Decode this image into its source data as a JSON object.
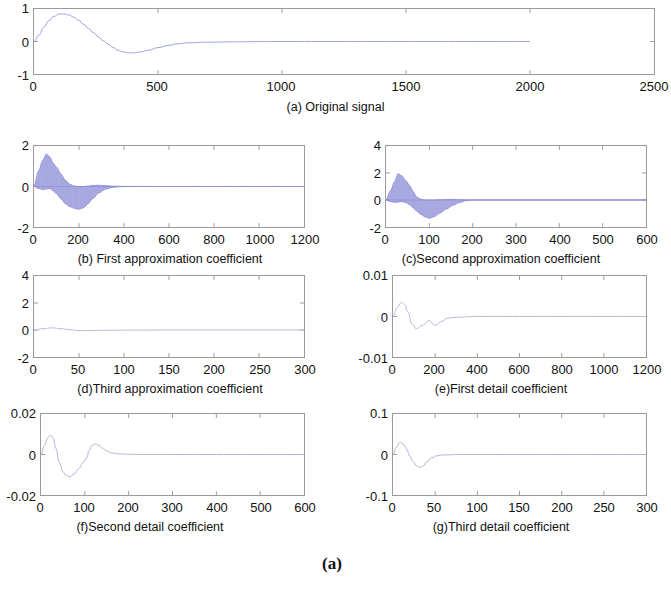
{
  "figure": {
    "label": "(a)",
    "panels": [
      {
        "key": "a",
        "caption": "(a) Original signal",
        "xticks": [
          "0",
          "500",
          "1000",
          "1500",
          "2000",
          "2500"
        ],
        "yticks": [
          "1",
          "0",
          "-1"
        ],
        "xlim": [
          0,
          2500
        ],
        "ylim": [
          -1,
          1
        ]
      },
      {
        "key": "b",
        "caption": "(b) First approximation coefficient",
        "xticks": [
          "0",
          "200",
          "400",
          "600",
          "800",
          "1000",
          "1200"
        ],
        "yticks": [
          "2",
          "0",
          "-2"
        ],
        "xlim": [
          0,
          1200
        ],
        "ylim": [
          -2,
          2
        ]
      },
      {
        "key": "c",
        "caption": "(c)Second approximation coefficient",
        "xticks": [
          "0",
          "100",
          "200",
          "300",
          "400",
          "500",
          "600"
        ],
        "yticks": [
          "4",
          "2",
          "0",
          "-2"
        ],
        "xlim": [
          0,
          600
        ],
        "ylim": [
          -2,
          4
        ]
      },
      {
        "key": "d",
        "caption": "(d)Third approximation coefficient",
        "xticks": [
          "0",
          "50",
          "100",
          "150",
          "200",
          "250",
          "300"
        ],
        "yticks": [
          "4",
          "2",
          "0",
          "-2"
        ],
        "xlim": [
          0,
          300
        ],
        "ylim": [
          -2,
          4
        ]
      },
      {
        "key": "e",
        "caption": "(e)First detail coefficient",
        "xticks": [
          "0",
          "200",
          "400",
          "600",
          "800",
          "1000",
          "1200"
        ],
        "yticks": [
          "0.01",
          "0",
          "-0.01"
        ],
        "xlim": [
          0,
          1200
        ],
        "ylim": [
          -0.01,
          0.01
        ]
      },
      {
        "key": "f",
        "caption": "(f)Second detail coefficient",
        "xticks": [
          "0",
          "100",
          "200",
          "300",
          "400",
          "500",
          "600"
        ],
        "yticks": [
          "0.02",
          "0",
          "-0.02"
        ],
        "xlim": [
          0,
          600
        ],
        "ylim": [
          -0.02,
          0.02
        ]
      },
      {
        "key": "g",
        "caption": "(g)Third detail coefficient",
        "xticks": [
          "0",
          "50",
          "100",
          "150",
          "200",
          "250",
          "300"
        ],
        "yticks": [
          "0.1",
          "0",
          "-0.1"
        ],
        "xlim": [
          0,
          300
        ],
        "ylim": [
          -0.1,
          0.1
        ]
      }
    ]
  },
  "chart_data": [
    {
      "type": "line",
      "title": "(a) Original signal",
      "xlabel": "",
      "ylabel": "",
      "xlim": [
        0,
        2500
      ],
      "ylim": [
        -1,
        1
      ],
      "xticks": [
        0,
        500,
        1000,
        1500,
        2000,
        2500
      ],
      "yticks": [
        -1,
        0,
        1
      ],
      "grid": false,
      "legend": "none",
      "color": "#9aa0dd",
      "series": [
        {
          "name": "original signal",
          "x": [
            0,
            20,
            40,
            60,
            80,
            100,
            120,
            140,
            160,
            180,
            200,
            220,
            240,
            260,
            280,
            300,
            320,
            340,
            360,
            380,
            400,
            430,
            460,
            500,
            540,
            580,
            620,
            700,
            800,
            900,
            1000,
            1200,
            1400,
            1600,
            1800,
            2000
          ],
          "y": [
            0,
            0.2,
            0.44,
            0.64,
            0.77,
            0.84,
            0.85,
            0.82,
            0.75,
            0.65,
            0.53,
            0.4,
            0.27,
            0.14,
            0.02,
            -0.09,
            -0.19,
            -0.27,
            -0.32,
            -0.35,
            -0.35,
            -0.32,
            -0.27,
            -0.19,
            -0.12,
            -0.07,
            -0.04,
            -0.02,
            -0.01,
            -0.005,
            0,
            0,
            0,
            0,
            0,
            0
          ]
        }
      ]
    },
    {
      "type": "line",
      "title": "(b) First approximation coefficient",
      "xlabel": "",
      "ylabel": "",
      "xlim": [
        0,
        1200
      ],
      "ylim": [
        -2,
        2
      ],
      "xticks": [
        0,
        200,
        400,
        600,
        800,
        1000,
        1200
      ],
      "yticks": [
        -2,
        0,
        2
      ],
      "grid": false,
      "legend": "none",
      "color": "#8f8fd8",
      "note": "dense high-frequency oscillation filling an envelope",
      "envelope": {
        "x": [
          0,
          20,
          40,
          55,
          70,
          85,
          100,
          120,
          140,
          160,
          180,
          200,
          220,
          240,
          260,
          290,
          320,
          350,
          380,
          420,
          500,
          700,
          900,
          1100,
          1200
        ],
        "upper": [
          0,
          0.75,
          1.3,
          1.6,
          1.45,
          1.15,
          0.95,
          0.6,
          0.3,
          0.1,
          0.02,
          0.0,
          0.0,
          0.02,
          0.05,
          0.06,
          0.04,
          0.02,
          0.01,
          0.005,
          0,
          0,
          0,
          0,
          0
        ],
        "lower": [
          0,
          -0.1,
          -0.15,
          -0.12,
          -0.1,
          -0.2,
          -0.35,
          -0.6,
          -0.85,
          -1.0,
          -1.08,
          -1.12,
          -1.05,
          -0.85,
          -0.6,
          -0.3,
          -0.12,
          -0.04,
          -0.01,
          0,
          0,
          0,
          0,
          0,
          0
        ]
      }
    },
    {
      "type": "line",
      "title": "(c)Second approximation coefficient",
      "xlabel": "",
      "ylabel": "",
      "xlim": [
        0,
        600
      ],
      "ylim": [
        -2,
        4
      ],
      "xticks": [
        0,
        100,
        200,
        300,
        400,
        500,
        600
      ],
      "yticks": [
        -2,
        0,
        2,
        4
      ],
      "grid": false,
      "legend": "none",
      "color": "#8f8fd8",
      "note": "dense high-frequency oscillation filling an envelope",
      "envelope": {
        "x": [
          0,
          10,
          20,
          28,
          36,
          45,
          55,
          62,
          70,
          80,
          90,
          100,
          110,
          125,
          140,
          155,
          170,
          185,
          200,
          250,
          350,
          450,
          550,
          600
        ],
        "upper": [
          0,
          0.65,
          1.35,
          1.95,
          1.8,
          1.45,
          1.05,
          0.65,
          0.25,
          0.06,
          0.0,
          0.0,
          0.0,
          0.02,
          0.04,
          0.04,
          0.02,
          0.01,
          0,
          0,
          0,
          0,
          0,
          0
        ],
        "lower": [
          0,
          -0.12,
          -0.18,
          -0.15,
          -0.12,
          -0.18,
          -0.35,
          -0.55,
          -0.8,
          -1.05,
          -1.25,
          -1.35,
          -1.25,
          -0.95,
          -0.65,
          -0.38,
          -0.18,
          -0.05,
          0,
          0,
          0,
          0,
          0,
          0
        ]
      }
    },
    {
      "type": "line",
      "title": "(d)Third approximation coefficient",
      "xlabel": "",
      "ylabel": "",
      "xlim": [
        0,
        300
      ],
      "ylim": [
        -2,
        4
      ],
      "xticks": [
        0,
        50,
        100,
        150,
        200,
        250,
        300
      ],
      "yticks": [
        -2,
        0,
        2,
        4
      ],
      "grid": false,
      "legend": "none",
      "color": "#b9b9e0",
      "note": "very faint near-zero trace with small activity near the origin",
      "series": [
        {
          "name": "third approximation coefficient",
          "x": [
            0,
            10,
            20,
            30,
            40,
            50,
            60,
            80,
            100,
            150,
            200,
            250,
            300
          ],
          "y": [
            0,
            0.1,
            0.16,
            0.1,
            0.02,
            -0.05,
            -0.04,
            -0.02,
            -0.01,
            0,
            0,
            0,
            0
          ]
        }
      ]
    },
    {
      "type": "line",
      "title": "(e)First detail coefficient",
      "xlabel": "",
      "ylabel": "",
      "xlim": [
        0,
        1200
      ],
      "ylim": [
        -0.01,
        0.01
      ],
      "xticks": [
        0,
        200,
        400,
        600,
        800,
        1000,
        1200
      ],
      "yticks": [
        -0.01,
        0,
        0.01
      ],
      "grid": false,
      "legend": "none",
      "color": "#b9b9e0",
      "note": "small transient near x<250 then flat at zero",
      "series": [
        {
          "name": "first detail coefficient",
          "x": [
            0,
            20,
            40,
            55,
            70,
            90,
            110,
            140,
            170,
            200,
            230,
            260,
            300,
            400,
            600,
            800,
            1000,
            1200
          ],
          "y": [
            0,
            0.0022,
            0.0035,
            0.003,
            0.0012,
            -0.0018,
            -0.003,
            -0.0022,
            -0.001,
            -0.0022,
            -0.0012,
            -0.0004,
            -0.0002,
            0,
            0,
            0,
            0,
            0
          ]
        }
      ]
    },
    {
      "type": "line",
      "title": "(f)Second detail coefficient",
      "xlabel": "",
      "ylabel": "",
      "xlim": [
        0,
        600
      ],
      "ylim": [
        -0.02,
        0.02
      ],
      "xticks": [
        0,
        100,
        200,
        300,
        400,
        500,
        600
      ],
      "yticks": [
        -0.02,
        0,
        0.02
      ],
      "grid": false,
      "legend": "none",
      "color": "#b0b0dc",
      "note": "damped oscillation decaying to zero after x~160",
      "series": [
        {
          "name": "second detail coefficient",
          "x": [
            0,
            8,
            16,
            22,
            28,
            34,
            42,
            50,
            58,
            66,
            76,
            86,
            96,
            104,
            110,
            116,
            124,
            132,
            140,
            150,
            160,
            180,
            200,
            250,
            300,
            400,
            500,
            600
          ],
          "y": [
            0,
            0.0045,
            0.0085,
            0.0095,
            0.008,
            0.003,
            -0.004,
            -0.0085,
            -0.0105,
            -0.011,
            -0.0095,
            -0.007,
            -0.004,
            -0.0018,
            0.002,
            0.0045,
            0.0052,
            0.0045,
            0.0032,
            0.0018,
            0.0008,
            0.0003,
            0.0001,
            0,
            0,
            0,
            0,
            0
          ]
        }
      ]
    },
    {
      "type": "line",
      "title": "(g)Third detail coefficient",
      "xlabel": "",
      "ylabel": "",
      "xlim": [
        0,
        300
      ],
      "ylim": [
        -0.1,
        0.1
      ],
      "xticks": [
        0,
        50,
        100,
        150,
        200,
        250,
        300
      ],
      "yticks": [
        -0.1,
        0,
        0.1
      ],
      "grid": false,
      "legend": "none",
      "color": "#b0b0dc",
      "note": "initial positive spike decaying through a negative dip to zero by x~60",
      "series": [
        {
          "name": "third detail coefficient",
          "x": [
            0,
            4,
            8,
            12,
            16,
            20,
            24,
            28,
            32,
            36,
            40,
            46,
            52,
            60,
            80,
            120,
            160,
            200,
            250,
            300
          ],
          "y": [
            0,
            0.018,
            0.03,
            0.026,
            0.014,
            -0.004,
            -0.018,
            -0.028,
            -0.032,
            -0.028,
            -0.018,
            -0.008,
            -0.003,
            -0.001,
            0,
            0,
            0,
            0,
            0,
            0
          ]
        }
      ]
    }
  ]
}
